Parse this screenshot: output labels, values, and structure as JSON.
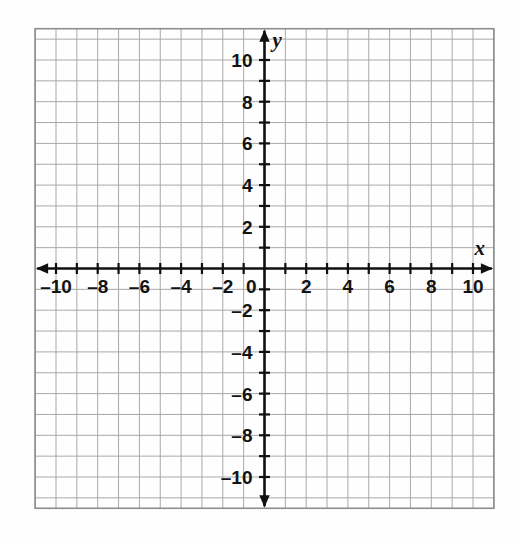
{
  "figure": {
    "kind": "coordinate-plane",
    "background_color": "#fefefe",
    "grid_color": "#a8a8a8",
    "grid_border_color": "#8d8d8d",
    "axis_color": "#101010"
  },
  "chart_data": {
    "type": "scatter",
    "title": "",
    "subtitle": "",
    "xlabel": "x",
    "ylabel": "y",
    "xlim": [
      -11,
      11
    ],
    "ylim": [
      -11.5,
      11.5
    ],
    "x_tick_interval": 1,
    "y_tick_interval": 1,
    "x_label_interval": 2,
    "y_label_interval": 2,
    "grid": true,
    "grid_interval": 1,
    "legend": null,
    "series": [],
    "x_tick_labels": [
      "–10",
      "–8",
      "–6",
      "–4",
      "–2",
      "0",
      "2",
      "4",
      "6",
      "8",
      "10"
    ],
    "x_tick_values": [
      -10,
      -8,
      -6,
      -4,
      -2,
      0,
      2,
      4,
      6,
      8,
      10
    ],
    "y_tick_labels": [
      "10",
      "8",
      "6",
      "4",
      "2",
      "–2",
      "–4",
      "–6",
      "–8",
      "–10"
    ],
    "y_tick_values": [
      10,
      8,
      6,
      4,
      2,
      -2,
      -4,
      -6,
      -8,
      -10
    ],
    "origin_label": "0",
    "annotations": []
  },
  "axis_labels": {
    "x_axis_name": "x",
    "y_axis_name": "y"
  }
}
